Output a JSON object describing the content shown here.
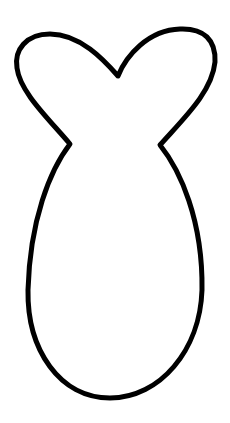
{
  "image": {
    "description": "Fish tail / bunny-ear outline shape",
    "background_color": "#ffffff",
    "stroke_color": "#000000",
    "stroke_width": 5
  }
}
